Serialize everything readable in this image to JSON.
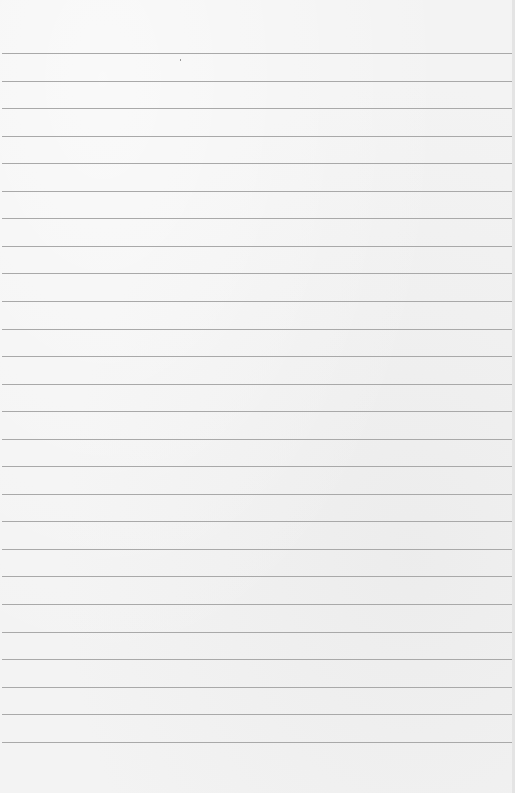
{
  "paper": {
    "kind": "lined-paper",
    "background_color": "#f3f3f3",
    "rule_color": "#a9a9a9",
    "rule_count": 26,
    "first_rule_y": 53,
    "rule_spacing": 27.55
  }
}
